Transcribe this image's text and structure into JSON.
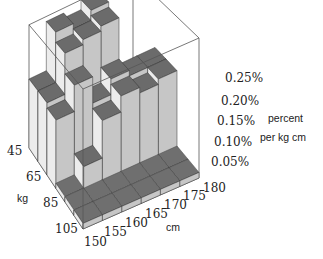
{
  "chart_data": {
    "type": "bar3d",
    "title": "",
    "xlabel": "cm",
    "ylabel": "kg",
    "zlabel": [
      "percent",
      "per kg cm"
    ],
    "x_ticks": [
      "150",
      "155",
      "160",
      "165",
      "170",
      "175",
      "180"
    ],
    "y_ticks": [
      "45",
      "65",
      "85",
      "105"
    ],
    "z_ticks": [
      "0.05%",
      "0.10%",
      "0.15%",
      "0.20%",
      "0.25%"
    ],
    "zlim": [
      0,
      0.25
    ],
    "x_bins": [
      [
        150,
        155
      ],
      [
        155,
        160
      ],
      [
        160,
        165
      ],
      [
        165,
        170
      ],
      [
        170,
        175
      ],
      [
        175,
        180
      ]
    ],
    "y_bins": [
      [
        45,
        55
      ],
      [
        55,
        65
      ],
      [
        65,
        75
      ],
      [
        75,
        85
      ],
      [
        85,
        95
      ],
      [
        95,
        105
      ]
    ],
    "values": [
      [
        0.14,
        0.24,
        0.23,
        0.25,
        0.0,
        0.0
      ],
      [
        0.14,
        0.22,
        0.23,
        0.24,
        0.0,
        0.0
      ],
      [
        0.13,
        0.18,
        0.13,
        0.16,
        0.15,
        0.15
      ],
      [
        0.01,
        0.05,
        0.12,
        0.15,
        0.14,
        0.15
      ],
      [
        0.01,
        0.01,
        0.01,
        0.01,
        0.01,
        0.01
      ],
      [
        0.01,
        0.01,
        0.01,
        0.01,
        0.01,
        0.01
      ]
    ],
    "grid": false,
    "legend": null
  }
}
